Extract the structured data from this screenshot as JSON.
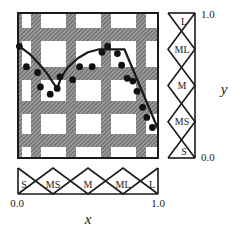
{
  "diagram": {
    "title": "",
    "type": "fuzzy-rule-grid",
    "x_axis": {
      "label": "x",
      "min_label": "0.0",
      "max_label": "1.0"
    },
    "y_axis": {
      "label": "y",
      "min_label": "0.0",
      "max_label": "1.0"
    },
    "x_membership_functions": [
      "S",
      "MS",
      "M",
      "ML",
      "L"
    ],
    "y_membership_functions": [
      "S",
      "MS",
      "M",
      "ML",
      "L"
    ],
    "colors": {
      "hatch": "#8a8a8a",
      "hatch_line": "#444444",
      "background": "#ffffff",
      "line": "#1a1a1a",
      "points": "#111111"
    },
    "data_points": [
      [
        0.01,
        0.77
      ],
      [
        0.06,
        0.63
      ],
      [
        0.14,
        0.59
      ],
      [
        0.16,
        0.49
      ],
      [
        0.23,
        0.44
      ],
      [
        0.28,
        0.48
      ],
      [
        0.3,
        0.56
      ],
      [
        0.39,
        0.54
      ],
      [
        0.44,
        0.63
      ],
      [
        0.53,
        0.63
      ],
      [
        0.6,
        0.73
      ],
      [
        0.64,
        0.77
      ],
      [
        0.71,
        0.72
      ],
      [
        0.74,
        0.64
      ],
      [
        0.78,
        0.55
      ],
      [
        0.82,
        0.53
      ],
      [
        0.85,
        0.46
      ],
      [
        0.89,
        0.35
      ],
      [
        0.92,
        0.28
      ],
      [
        0.96,
        0.21
      ]
    ],
    "curve": [
      [
        0.01,
        0.77
      ],
      [
        0.08,
        0.72
      ],
      [
        0.15,
        0.65
      ],
      [
        0.21,
        0.58
      ],
      [
        0.25,
        0.52
      ],
      [
        0.28,
        0.48
      ],
      [
        0.31,
        0.56
      ],
      [
        0.36,
        0.63
      ],
      [
        0.43,
        0.69
      ],
      [
        0.5,
        0.73
      ],
      [
        0.58,
        0.75
      ],
      [
        0.66,
        0.75
      ],
      [
        0.76,
        0.75
      ],
      [
        1.0,
        0.2
      ]
    ]
  }
}
